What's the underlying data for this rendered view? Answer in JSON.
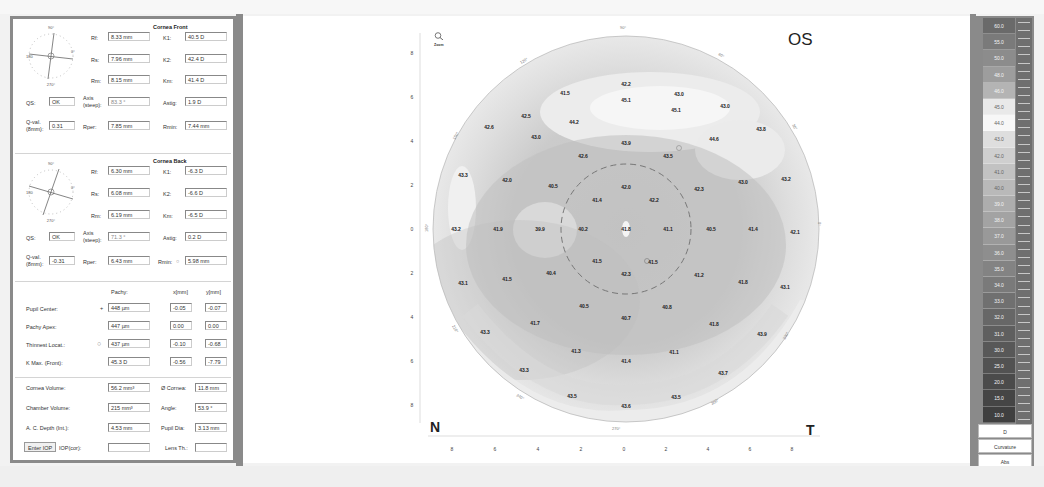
{
  "cornea_front": {
    "title": "Cornea Front",
    "rf_label": "Rf:",
    "rf": "8.33 mm",
    "k1_label": "K1:",
    "k1": "40.5 D",
    "rs_label": "Rs:",
    "rs": "7.96 mm",
    "k2_label": "K2:",
    "k2": "42.4 D",
    "rm_label": "Rm:",
    "rm": "8.15 mm",
    "km_label": "Km:",
    "km": "41.4 D",
    "qs_label": "QS:",
    "qs": "OK",
    "axis_label_1": "Axis",
    "axis_label_2": "(steep):",
    "axis": "83.3 °",
    "astig_label": "Astig:",
    "astig": "1.9 D",
    "qval_label_1": "Q-val.",
    "qval_label_2": "(8mm):",
    "qval": "0.31",
    "rper_label": "Rper:",
    "rper": "7.85 mm",
    "rmin_label": "Rmin:",
    "rmin": "7.44 mm",
    "dial": {
      "top": "90°",
      "left": "180",
      "right": "0°",
      "bottom": "270°"
    }
  },
  "cornea_back": {
    "title": "Cornea Back",
    "rf_label": "Rf:",
    "rf": "6.30 mm",
    "k1_label": "K1:",
    "k1": "-6.3 D",
    "rs_label": "Rs:",
    "rs": "6.08 mm",
    "k2_label": "K2:",
    "k2": "-6.6 D",
    "rm_label": "Rm:",
    "rm": "6.19 mm",
    "km_label": "Km:",
    "km": "-6.5 D",
    "qs_label": "QS:",
    "qs": "OK",
    "axis_label_1": "Axis",
    "axis_label_2": "(steep):",
    "axis": "71.3 °",
    "astig_label": "Astig:",
    "astig": "0.2 D",
    "qval_label_1": "Q-val.",
    "qval_label_2": "(8mm):",
    "qval": "-0.31",
    "rper_label": "Rper:",
    "rper": "6.43 mm",
    "rmin_label": "Rmin:",
    "rmin": "5.98 mm",
    "dial": {
      "top": "90°",
      "left": "180",
      "right": "0°",
      "bottom": "270°"
    }
  },
  "pachy": {
    "col_pachy": "Pachy:",
    "col_x": "x[mm]",
    "col_y": "y[mm]",
    "rows": [
      {
        "label": "Pupil Center:",
        "marker": "+",
        "pachy": "448 µm",
        "x": "-0.05",
        "y": "-0.07"
      },
      {
        "label": "Pachy Apex:",
        "marker": "",
        "pachy": "447 µm",
        "x": "0.00",
        "y": "0.00"
      },
      {
        "label": "Thinnest Locat.:",
        "marker": "○",
        "pachy": "437 µm",
        "x": "-0.10",
        "y": "-0.68"
      },
      {
        "label": "K Max. (Front):",
        "marker": "",
        "pachy": "45.3 D",
        "x": "-0.56",
        "y": "-7.79"
      }
    ]
  },
  "volumes": {
    "cornea_volume_label": "Cornea Volume:",
    "cornea_volume": "56.2 mm³",
    "cornea_diam_label": "Ø Cornea:",
    "cornea_diam": "11.8 mm",
    "chamber_volume_label": "Chamber Volume:",
    "chamber_volume": "215 mm³",
    "angle_label": "Angle:",
    "angle": "53.9 °",
    "ac_depth_label": "A. C. Depth (Int.):",
    "ac_depth": "4.53 mm",
    "pupil_dia_label": "Pupil Dia:",
    "pupil_dia": "3.13 mm",
    "enter_iop_button": "Enter IOP",
    "iop_label": "IOP(cor):",
    "iop": "",
    "lens_th_label": "Lens Th.:",
    "lens_th": ""
  },
  "map": {
    "eye": "OS",
    "nasal": "N",
    "temporal": "T",
    "zoom_icon_label": "Zoom",
    "y_ticks": [
      "8",
      "6",
      "4",
      "2",
      "0",
      "2",
      "4",
      "6",
      "8"
    ],
    "x_ticks": [
      "8",
      "6",
      "4",
      "2",
      "0",
      "2",
      "4",
      "6",
      "8"
    ],
    "angle_labels": [
      "90°",
      "120°",
      "150°",
      "180°",
      "210°",
      "240°",
      "270°",
      "300°",
      "330°",
      "0°",
      "30°",
      "60°"
    ],
    "values": [
      {
        "v": "41.5",
        "x": 565,
        "y": 93
      },
      {
        "v": "42.2",
        "x": 626,
        "y": 84
      },
      {
        "v": "43.0",
        "x": 679,
        "y": 94
      },
      {
        "v": "42.5",
        "x": 526,
        "y": 116
      },
      {
        "v": "44.2",
        "x": 574,
        "y": 122
      },
      {
        "v": "45.1",
        "x": 626,
        "y": 100
      },
      {
        "v": "45.1",
        "x": 676,
        "y": 110
      },
      {
        "v": "43.0",
        "x": 725,
        "y": 106
      },
      {
        "v": "42.6",
        "x": 489,
        "y": 127
      },
      {
        "v": "43.0",
        "x": 536,
        "y": 137
      },
      {
        "v": "43.9",
        "x": 626,
        "y": 143
      },
      {
        "v": "44.6",
        "x": 714,
        "y": 139
      },
      {
        "v": "43.8",
        "x": 761,
        "y": 129
      },
      {
        "v": "42.6",
        "x": 583,
        "y": 156
      },
      {
        "v": "43.5",
        "x": 668,
        "y": 156
      },
      {
        "v": "43.3",
        "x": 463,
        "y": 175
      },
      {
        "v": "42.0",
        "x": 507,
        "y": 180
      },
      {
        "v": "40.5",
        "x": 553,
        "y": 186
      },
      {
        "v": "42.0",
        "x": 626,
        "y": 187
      },
      {
        "v": "42.3",
        "x": 699,
        "y": 189
      },
      {
        "v": "43.0",
        "x": 743,
        "y": 182
      },
      {
        "v": "43.2",
        "x": 786,
        "y": 179
      },
      {
        "v": "41.4",
        "x": 597,
        "y": 200
      },
      {
        "v": "42.2",
        "x": 654,
        "y": 200
      },
      {
        "v": "43.2",
        "x": 456,
        "y": 229
      },
      {
        "v": "41.9",
        "x": 498,
        "y": 229
      },
      {
        "v": "39.9",
        "x": 540,
        "y": 229
      },
      {
        "v": "40.2",
        "x": 583,
        "y": 229
      },
      {
        "v": "41.8",
        "x": 626,
        "y": 229
      },
      {
        "v": "41.1",
        "x": 668,
        "y": 229
      },
      {
        "v": "40.5",
        "x": 711,
        "y": 229
      },
      {
        "v": "41.4",
        "x": 753,
        "y": 229
      },
      {
        "v": "42.1",
        "x": 795,
        "y": 232
      },
      {
        "v": "41.5",
        "x": 597,
        "y": 261
      },
      {
        "v": "41.5",
        "x": 653,
        "y": 262
      },
      {
        "v": "43.1",
        "x": 463,
        "y": 283
      },
      {
        "v": "41.5",
        "x": 507,
        "y": 279
      },
      {
        "v": "40.4",
        "x": 551,
        "y": 273
      },
      {
        "v": "42.3",
        "x": 626,
        "y": 274
      },
      {
        "v": "41.2",
        "x": 699,
        "y": 275
      },
      {
        "v": "41.8",
        "x": 743,
        "y": 282
      },
      {
        "v": "43.1",
        "x": 785,
        "y": 287
      },
      {
        "v": "40.5",
        "x": 584,
        "y": 306
      },
      {
        "v": "40.8",
        "x": 667,
        "y": 307
      },
      {
        "v": "40.7",
        "x": 626,
        "y": 318
      },
      {
        "v": "41.7",
        "x": 535,
        "y": 323
      },
      {
        "v": "41.8",
        "x": 714,
        "y": 324
      },
      {
        "v": "43.3",
        "x": 485,
        "y": 332
      },
      {
        "v": "43.9",
        "x": 762,
        "y": 334
      },
      {
        "v": "41.3",
        "x": 576,
        "y": 351
      },
      {
        "v": "41.1",
        "x": 674,
        "y": 352
      },
      {
        "v": "41.4",
        "x": 626,
        "y": 361
      },
      {
        "v": "43.3",
        "x": 524,
        "y": 370
      },
      {
        "v": "43.7",
        "x": 723,
        "y": 373
      },
      {
        "v": "43.5",
        "x": 572,
        "y": 396
      },
      {
        "v": "43.5",
        "x": 676,
        "y": 397
      },
      {
        "v": "43.6",
        "x": 626,
        "y": 406
      }
    ]
  },
  "scale": {
    "values": [
      "60.0",
      "55.0",
      "50.0",
      "48.0",
      "46.0",
      "45.0",
      "44.0",
      "43.0",
      "42.0",
      "41.0",
      "40.0",
      "39.0",
      "38.0",
      "37.0",
      "36.0",
      "35.0",
      "34.0",
      "33.0",
      "32.0",
      "31.0",
      "30.0",
      "25.0",
      "20.0",
      "15.0",
      "10.0"
    ],
    "colors": [
      "#6a6a6a",
      "#7a7a7a",
      "#8c8c8c",
      "#9d9d9d",
      "#b4b4b4",
      "#e9e9e9",
      "#f7f7f7",
      "#dedede",
      "#cfcfcf",
      "#c2c2c2",
      "#b9b9b9",
      "#adadad",
      "#a3a3a3",
      "#999999",
      "#8e8e8e",
      "#838383",
      "#7a7a7a",
      "#707070",
      "#676767",
      "#5f5f5f",
      "#585858",
      "#525252",
      "#4b4b4b",
      "#454545",
      "#3f3f3f"
    ],
    "unit_button": "D",
    "mode_button": "Curvature",
    "abs_button": "Abs"
  }
}
